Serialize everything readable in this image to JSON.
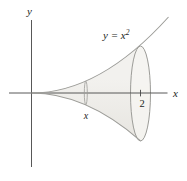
{
  "figure": {
    "curve_label": {
      "base": "y = x",
      "exponent": "2"
    },
    "y_axis_label": "y",
    "x_axis_label": "x",
    "x_tick_label": "2",
    "slice_label": "x"
  },
  "colors": {
    "axis": "#454545",
    "curve": "#9c9c98",
    "body-top": "#f2f1ee",
    "body-bottom": "#e7e5e0",
    "face": "#f5f4f1",
    "text": "#1d1d1b",
    "bg": "#ffffff"
  }
}
